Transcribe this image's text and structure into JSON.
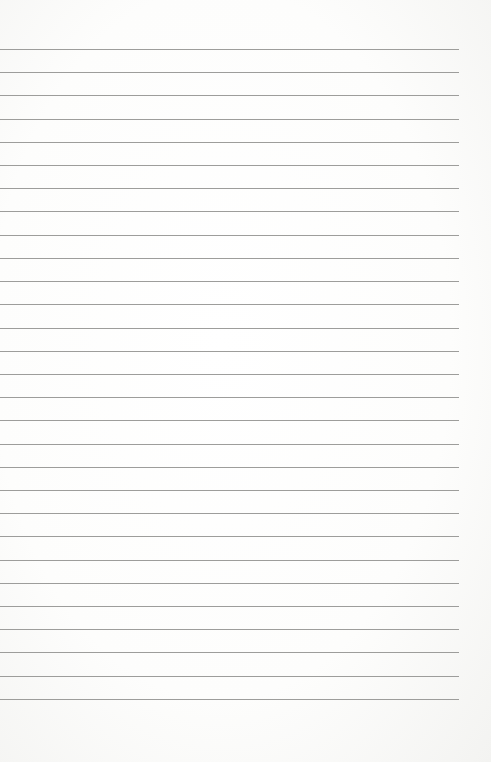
{
  "page": {
    "type": "lined-paper",
    "background_color": "#ffffff",
    "line_color": "#9d9d9b",
    "line_count": 29,
    "first_line_y": 49,
    "line_spacing": 23.21,
    "line_left": 0,
    "line_right": 459
  }
}
